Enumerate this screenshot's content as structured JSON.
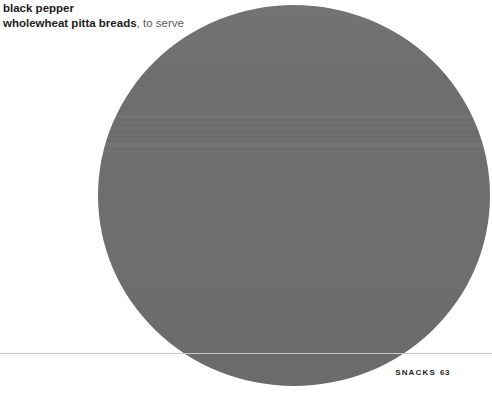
{
  "page": {
    "background_color": "#ffffff",
    "width": 492,
    "height": 398
  },
  "ingredients": {
    "lines": [
      {
        "bold": "black pepper",
        "regular": ""
      },
      {
        "bold": "wholewheat pitta breads",
        "regular": ", to serve"
      }
    ],
    "line1_bold": "black pepper",
    "line1_regular": "",
    "line2_bold": "wholewheat pitta breads",
    "line2_regular": ", to serve",
    "bold_color": "#1d1d1d",
    "regular_color": "#5d5d5d"
  },
  "photo": {
    "shape": "circle",
    "fill_color": "#6e6e6e",
    "description": "food-photograph-circular-crop"
  },
  "divider": {
    "color": "#c9c9c9"
  },
  "footer": {
    "section": "SNACKS",
    "page_number": "63",
    "color": "#1d1d1d"
  }
}
